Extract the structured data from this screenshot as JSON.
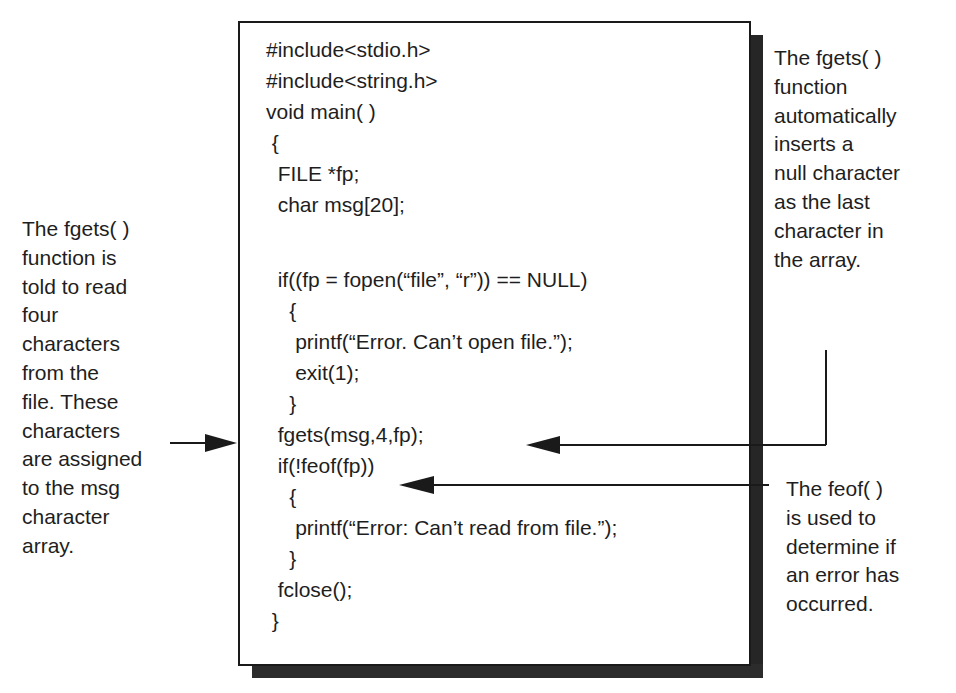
{
  "code": {
    "lines": [
      "#include<stdio.h>",
      "#include<string.h>",
      "void main( )",
      " {",
      "  FILE *fp;",
      "  char msg[20];",
      "",
      "  if((fp = fopen(“file”, “r”)) == NULL)",
      "    {",
      "     printf(“Error. Can’t open file.”);",
      "     exit(1);",
      "    }",
      "  fgets(msg,4,fp);",
      "  if(!feof(fp))",
      "    {",
      "     printf(“Error: Can’t read from file.”);",
      "    }",
      "  fclose();",
      " }"
    ]
  },
  "annotations": {
    "left": "The fgets( )\nfunction is\ntold to read\nfour\ncharacters\nfrom the\nfile. These\ncharacters\nare assigned\nto the msg\ncharacter\narray.",
    "right_top": "The fgets( )\nfunction\nautomatically\ninserts a\nnull character\nas the last\ncharacter in\nthe array.",
    "right_bottom": "The feof( )\nis used to\ndetermine if\nan error has\noccurred."
  },
  "colors": {
    "ink": "#1e1e1e",
    "shadow": "#262626",
    "background": "#ffffff"
  }
}
